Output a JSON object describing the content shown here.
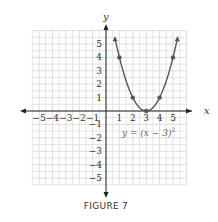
{
  "chart_data": {
    "type": "line",
    "title": "",
    "equation": "y = (x − 3)²",
    "equation_sup": "2",
    "equation_base": "y = (x − 3)",
    "xlabel": "x",
    "ylabel": "y",
    "xlim": [
      -5.5,
      6
    ],
    "ylim": [
      -5.5,
      6
    ],
    "grid": true,
    "x_ticks": [
      -5,
      -4,
      -3,
      -2,
      -1,
      1,
      2,
      3,
      4,
      5
    ],
    "y_ticks": [
      5,
      4,
      3,
      2,
      1,
      -1,
      -2,
      -3,
      -4,
      -5
    ],
    "x_tick_labels": [
      "−5",
      "−4",
      "−3",
      "−2",
      "−1",
      "1",
      "2",
      "3",
      "4",
      "5"
    ],
    "y_tick_labels": [
      "5",
      "4",
      "3",
      "2",
      "1",
      "−1",
      "−2",
      "−3",
      "−4",
      "−5"
    ],
    "points": [
      {
        "x": 1,
        "y": 4
      },
      {
        "x": 2,
        "y": 1
      },
      {
        "x": 3,
        "y": 0
      },
      {
        "x": 4,
        "y": 1
      },
      {
        "x": 5,
        "y": 4
      }
    ],
    "curve_color": "#555555",
    "caption": "FIGURE 7"
  }
}
